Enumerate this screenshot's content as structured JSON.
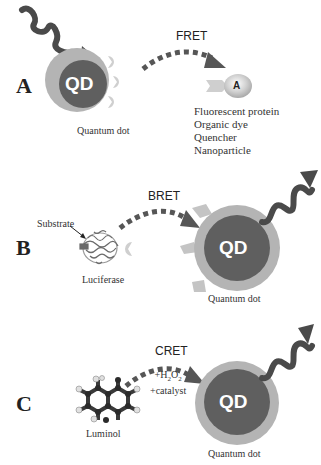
{
  "colors": {
    "qd_core": "#5f5f5f",
    "qd_shell": "#b4b4b4",
    "ligand": "#cfcfcf",
    "wave": "#4a4a4a",
    "arrow": "#565656",
    "acceptor": "#c8c8c8",
    "text": "#333333"
  },
  "panels": [
    {
      "letter": "A",
      "method": "FRET",
      "donor_label": "QD",
      "donor_caption": "Quantum dot",
      "acceptor_label": "A",
      "acceptor_types": [
        "Fluorescent protein",
        "Organic dye",
        "Quencher",
        "Nanoparticle"
      ]
    },
    {
      "letter": "B",
      "method": "BRET",
      "donor_caption": "Luciferase",
      "substrate_label": "Substrate",
      "acceptor_label": "QD",
      "acceptor_caption": "Quantum dot"
    },
    {
      "letter": "C",
      "method": "CRET",
      "donor_caption": "Luminol",
      "reagents": [
        "+H2O2",
        "+catalyst"
      ],
      "reagent_h2o2": {
        "prefix": "+H",
        "sub1": "2",
        "mid": "O",
        "sub2": "2"
      },
      "acceptor_label": "QD",
      "acceptor_caption": "Quantum dot"
    }
  ]
}
